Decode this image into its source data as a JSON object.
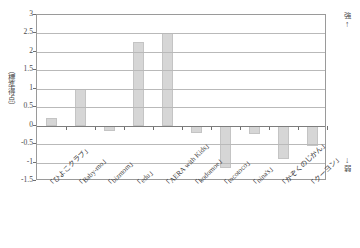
{
  "chart_data": {
    "type": "bar",
    "title": "",
    "xlabel": "",
    "ylabel": "（標準得点）",
    "ylim": [
      -1.5,
      3
    ],
    "ytick_step": 0.5,
    "yticks": [
      "3",
      "2.5",
      "2",
      "1.5",
      "1",
      "0.5",
      "0",
      "-0.5",
      "-1",
      "-1.5"
    ],
    "grid": true,
    "legend": "none",
    "bar_color": "#d6d6d6",
    "categories": [
      "「ひよこクラブ」",
      "「Baby-mo」",
      "「bizmom」",
      "「edu」",
      "「AERA with Kids」",
      "「kodomoe」",
      "「tocotoco」",
      "「nina's」",
      "「かぞくのじかん」",
      "「クーヨン」"
    ],
    "values": [
      0.2,
      1.0,
      -0.15,
      2.28,
      2.5,
      -0.2,
      -1.15,
      -0.22,
      -0.9,
      -0.55
    ],
    "annotations": {
      "top_label": "強",
      "top_arrow": "↑",
      "bottom_arrow": "↓",
      "bottom_label": "弱"
    }
  }
}
